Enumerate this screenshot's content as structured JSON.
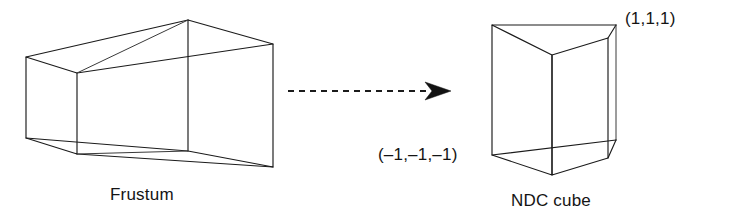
{
  "figure": {
    "background_color": "#ffffff",
    "line_color": "#1b1b1b",
    "text_color": "#141414"
  },
  "labels": {
    "frustum_caption": "Frustum",
    "ndc_caption": "NDC cube",
    "max_corner": "(1,1,1)",
    "min_corner": "(–1,–1,–1)"
  },
  "arrow": {
    "style": "dashed",
    "direction": "right",
    "shaft_start_x": 288,
    "shaft_end_x": 428,
    "y": 91
  },
  "frustum": {
    "shape": "truncated-pyramid-wireframe",
    "near_face_label": "small-left-face",
    "far_face_label": "large-right-face"
  },
  "ndc_cube": {
    "shape": "cube-wireframe",
    "min": "(-1,-1,-1)",
    "max": "(1,1,1)"
  }
}
